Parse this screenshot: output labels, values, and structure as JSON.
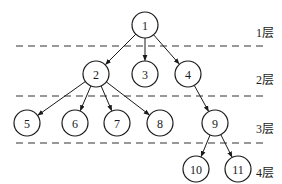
{
  "diagram": {
    "type": "tree",
    "nodes": [
      {
        "id": "1",
        "label": "1",
        "layer": 1
      },
      {
        "id": "2",
        "label": "2",
        "layer": 2
      },
      {
        "id": "3",
        "label": "3",
        "layer": 2
      },
      {
        "id": "4",
        "label": "4",
        "layer": 2
      },
      {
        "id": "5",
        "label": "5",
        "layer": 3
      },
      {
        "id": "6",
        "label": "6",
        "layer": 3
      },
      {
        "id": "7",
        "label": "7",
        "layer": 3
      },
      {
        "id": "8",
        "label": "8",
        "layer": 3
      },
      {
        "id": "9",
        "label": "9",
        "layer": 3
      },
      {
        "id": "10",
        "label": "10",
        "layer": 4
      },
      {
        "id": "11",
        "label": "11",
        "layer": 4
      }
    ],
    "edges": [
      {
        "from": "1",
        "to": "2"
      },
      {
        "from": "1",
        "to": "3"
      },
      {
        "from": "1",
        "to": "4"
      },
      {
        "from": "2",
        "to": "5"
      },
      {
        "from": "2",
        "to": "6"
      },
      {
        "from": "2",
        "to": "7"
      },
      {
        "from": "2",
        "to": "8"
      },
      {
        "from": "4",
        "to": "9"
      },
      {
        "from": "9",
        "to": "10"
      },
      {
        "from": "9",
        "to": "11"
      }
    ],
    "layers": [
      {
        "id": 1,
        "label": "1层"
      },
      {
        "id": 2,
        "label": "2层"
      },
      {
        "id": 3,
        "label": "3层"
      },
      {
        "id": 4,
        "label": "4层"
      }
    ]
  }
}
